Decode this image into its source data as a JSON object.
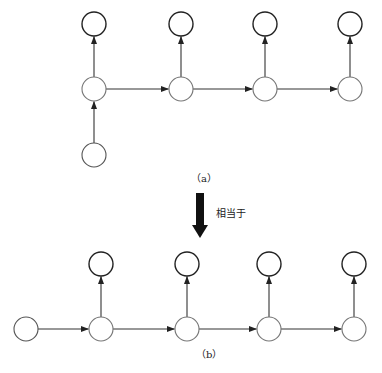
{
  "diagram_a": {
    "caption": "（a）",
    "radius": 12,
    "nodes": [
      {
        "id": "y1",
        "cx": 94,
        "cy": 24,
        "role": "output"
      },
      {
        "id": "y2",
        "cx": 181,
        "cy": 24,
        "role": "output"
      },
      {
        "id": "y3",
        "cx": 265,
        "cy": 24,
        "role": "output"
      },
      {
        "id": "y4",
        "cx": 350,
        "cy": 24,
        "role": "output"
      },
      {
        "id": "h1",
        "cx": 94,
        "cy": 89,
        "role": "hidden"
      },
      {
        "id": "h2",
        "cx": 181,
        "cy": 89,
        "role": "hidden"
      },
      {
        "id": "h3",
        "cx": 265,
        "cy": 89,
        "role": "hidden"
      },
      {
        "id": "h4",
        "cx": 350,
        "cy": 89,
        "role": "hidden"
      },
      {
        "id": "x",
        "cx": 94,
        "cy": 155,
        "role": "input"
      }
    ],
    "edges": [
      [
        "x",
        "h1"
      ],
      [
        "h1",
        "y1"
      ],
      [
        "h1",
        "h2"
      ],
      [
        "h2",
        "y2"
      ],
      [
        "h2",
        "h3"
      ],
      [
        "h3",
        "y3"
      ],
      [
        "h3",
        "h4"
      ],
      [
        "h4",
        "y4"
      ]
    ]
  },
  "equivalence": {
    "label": "相当于",
    "arrow_color": "#111111"
  },
  "diagram_b": {
    "caption": "（b）",
    "radius": 12,
    "nodes": [
      {
        "id": "x",
        "cx": 26,
        "cy": 329,
        "role": "input"
      },
      {
        "id": "h1",
        "cx": 101,
        "cy": 329,
        "role": "hidden"
      },
      {
        "id": "h2",
        "cx": 187,
        "cy": 329,
        "role": "hidden"
      },
      {
        "id": "h3",
        "cx": 269,
        "cy": 329,
        "role": "hidden"
      },
      {
        "id": "h4",
        "cx": 354,
        "cy": 329,
        "role": "hidden"
      },
      {
        "id": "y1",
        "cx": 101,
        "cy": 264,
        "role": "output"
      },
      {
        "id": "y2",
        "cx": 187,
        "cy": 264,
        "role": "output"
      },
      {
        "id": "y3",
        "cx": 269,
        "cy": 264,
        "role": "output"
      },
      {
        "id": "y4",
        "cx": 354,
        "cy": 264,
        "role": "output"
      }
    ],
    "edges": [
      [
        "x",
        "h1"
      ],
      [
        "h1",
        "y1"
      ],
      [
        "h1",
        "h2"
      ],
      [
        "h2",
        "y2"
      ],
      [
        "h2",
        "h3"
      ],
      [
        "h3",
        "y3"
      ],
      [
        "h3",
        "h4"
      ],
      [
        "h4",
        "y4"
      ]
    ]
  },
  "colors": {
    "output_stroke": "#222222",
    "hidden_stroke": "#777777",
    "input_stroke": "#555555",
    "edge": "#333333"
  }
}
